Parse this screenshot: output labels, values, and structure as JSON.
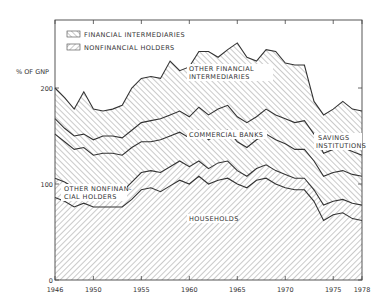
{
  "chart_data": {
    "type": "area",
    "stacked": true,
    "title": "",
    "ylabel": "% OF GNP",
    "xlabel": "",
    "ylim": [
      0,
      260
    ],
    "xlim": [
      1946,
      1978
    ],
    "x_ticks": [
      "1946",
      "1950",
      "1955",
      "1960",
      "1965",
      "1970",
      "1975",
      "1978"
    ],
    "y_ticks": [
      "0",
      "100",
      "200"
    ],
    "legend": [
      {
        "label": "FINANCIAL INTERMEDIARIES",
        "pattern": "backslash-hatch"
      },
      {
        "label": "NONFINANCIAL HOLDERS",
        "pattern": "slash-hatch"
      }
    ],
    "x": [
      1946,
      1947,
      1948,
      1949,
      1950,
      1951,
      1952,
      1953,
      1954,
      1955,
      1956,
      1957,
      1958,
      1959,
      1960,
      1961,
      1962,
      1963,
      1964,
      1965,
      1966,
      1967,
      1968,
      1969,
      1970,
      1971,
      1972,
      1973,
      1974,
      1975,
      1976,
      1977,
      1978
    ],
    "series": [
      {
        "name": "HOUSEHOLDS",
        "group": "NONFINANCIAL HOLDERS",
        "values": [
          86,
          82,
          76,
          80,
          76,
          76,
          76,
          76,
          84,
          94,
          96,
          92,
          98,
          104,
          100,
          108,
          100,
          104,
          106,
          100,
          96,
          104,
          106,
          100,
          96,
          94,
          94,
          82,
          62,
          68,
          70,
          64,
          62
        ]
      },
      {
        "name": "OTHER NONFINANCIAL HOLDERS",
        "group": "NONFINANCIAL HOLDERS",
        "values": [
          20,
          20,
          20,
          16,
          16,
          18,
          18,
          16,
          18,
          18,
          18,
          20,
          20,
          20,
          18,
          16,
          16,
          18,
          18,
          14,
          12,
          12,
          14,
          14,
          14,
          12,
          12,
          12,
          16,
          14,
          14,
          16,
          16
        ]
      },
      {
        "name": "COMMERCIAL BANKS",
        "group": "FINANCIAL INTERMEDIARIES",
        "values": [
          46,
          42,
          40,
          42,
          38,
          38,
          38,
          38,
          36,
          32,
          30,
          34,
          32,
          30,
          30,
          32,
          30,
          30,
          32,
          30,
          30,
          30,
          32,
          32,
          32,
          30,
          30,
          30,
          30,
          30,
          30,
          30,
          30
        ]
      },
      {
        "name": "SAVINGS INSTITUTIONS",
        "group": "FINANCIAL INTERMEDIARIES",
        "values": [
          16,
          14,
          14,
          14,
          16,
          18,
          18,
          18,
          18,
          20,
          22,
          22,
          22,
          22,
          22,
          24,
          26,
          26,
          26,
          26,
          26,
          24,
          26,
          26,
          26,
          28,
          30,
          28,
          24,
          24,
          24,
          24,
          22
        ]
      },
      {
        "name": "OTHER FINANCIAL INTERMEDIARIES",
        "group": "FINANCIAL INTERMEDIARIES",
        "values": [
          32,
          32,
          28,
          44,
          32,
          26,
          28,
          34,
          44,
          46,
          46,
          42,
          56,
          42,
          52,
          58,
          66,
          54,
          58,
          77,
          68,
          58,
          62,
          66,
          58,
          60,
          58,
          34,
          40,
          42,
          48,
          44,
          46
        ]
      }
    ],
    "annotations": [
      "OTHER FINANCIAL INTERMEDIARIES",
      "COMMERCIAL BANKS",
      "SAVINGS INSTITUTIONS",
      "OTHER NONFINANCIAL HOLDERS",
      "HOUSEHOLDS"
    ],
    "grid": false,
    "legend_position": "upper-left-inside"
  },
  "labels": {
    "ylabel": "% OF GNP",
    "legend_fin": "FINANCIAL INTERMEDIARIES",
    "legend_nonfin": "NONFINANCIAL HOLDERS",
    "ofi_1": "OTHER FINANCIAL",
    "ofi_2": "INTERMEDIARIES",
    "cb": "COMMERCIAL BANKS",
    "si_1": "SAVINGS",
    "si_2": "INSTITUTIONS",
    "onh_1": "OTHER NONFINAN-",
    "onh_2": "CIAL HOLDERS",
    "hh": "HOUSEHOLDS"
  }
}
